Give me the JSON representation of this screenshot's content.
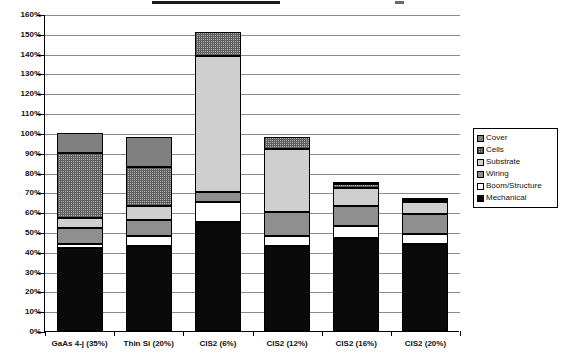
{
  "chart_data": {
    "type": "bar",
    "subtype": "stacked-bar",
    "title": "",
    "xlabel": "",
    "ylabel": "",
    "ylim": [
      0,
      160
    ],
    "ytick_labels": [
      "0%",
      "10%",
      "20%",
      "30%",
      "40%",
      "50%",
      "60%",
      "70%",
      "80%",
      "90%",
      "100%",
      "110%",
      "120%",
      "130%",
      "140%",
      "150%",
      "160%"
    ],
    "ytick_values": [
      0,
      10,
      20,
      30,
      40,
      50,
      60,
      70,
      80,
      90,
      100,
      110,
      120,
      130,
      140,
      150,
      160
    ],
    "grid": true,
    "legend_position": "right",
    "categories": [
      "GaAs 4-j (35%)",
      "Thin Si (20%)",
      "CIS2 (6%)",
      "CIS2 (12%)",
      "CIS2 (16%)",
      "CIS2 (20%)"
    ],
    "series": [
      {
        "name": "Mechanical",
        "values": [
          42,
          43,
          55,
          43,
          47,
          44
        ]
      },
      {
        "name": "Boom/Structure",
        "values": [
          2,
          5,
          10,
          5,
          6,
          5
        ]
      },
      {
        "name": "Wiring",
        "values": [
          8,
          8,
          5,
          12,
          10,
          10
        ]
      },
      {
        "name": "Substrate",
        "values": [
          5,
          7,
          69,
          32,
          9,
          6
        ]
      },
      {
        "name": "Cells",
        "values": [
          33,
          20,
          12,
          6,
          2,
          1
        ]
      },
      {
        "name": "Cover",
        "values": [
          10,
          15,
          0,
          0,
          1,
          1
        ]
      }
    ],
    "totals": [
      100,
      98,
      151,
      98,
      75,
      67
    ]
  },
  "legend": {
    "items": [
      {
        "label": "Cover",
        "swatch": "solid-gray"
      },
      {
        "label": "Cells",
        "swatch": "checker"
      },
      {
        "label": "Substrate",
        "swatch": "light-gray"
      },
      {
        "label": "Wiring",
        "swatch": "mid-gray"
      },
      {
        "label": "Boom/Structure",
        "swatch": "white"
      },
      {
        "label": "Mechanical",
        "swatch": "black"
      }
    ]
  },
  "colors": {
    "mechanical": "#0a0a0a",
    "boom": "#ffffff",
    "wiring": "#8f8f8f",
    "substrate": "#cfcfcf",
    "cells": "#b4b4b4",
    "cover": "#808080",
    "gridline": "#8c8c8c",
    "axis": "#000000"
  }
}
